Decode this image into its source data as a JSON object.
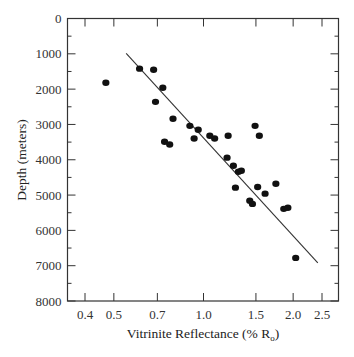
{
  "chart_data": {
    "type": "scatter",
    "title": "",
    "xlabel": "Vitrinite Reflectance  (% R",
    "xlabel_sub": "o",
    "xlabel_end": ")",
    "ylabel": "Depth  (meters)",
    "x_scale": "log",
    "xlim": [
      0.34,
      2.8
    ],
    "ylim": [
      8000,
      0
    ],
    "y_inverted": true,
    "grid": false,
    "legend": null,
    "x_ticks": [
      0.4,
      0.5,
      0.7,
      1.0,
      1.5,
      2.0,
      2.5
    ],
    "x_tick_labels": [
      "0.4",
      "0.5",
      "0.7",
      "1.0",
      "1.5",
      "2.0",
      "2.5"
    ],
    "y_ticks": [
      0,
      1000,
      2000,
      3000,
      4000,
      5000,
      6000,
      7000,
      8000
    ],
    "y_tick_labels": [
      "0",
      "1000",
      "2000",
      "3000",
      "4000",
      "5000",
      "6000",
      "7000",
      "8000"
    ],
    "series": [
      {
        "name": "samples",
        "points": [
          {
            "x": 0.47,
            "y": 1820
          },
          {
            "x": 0.61,
            "y": 1420
          },
          {
            "x": 0.68,
            "y": 1450
          },
          {
            "x": 0.73,
            "y": 1960
          },
          {
            "x": 0.69,
            "y": 2360
          },
          {
            "x": 0.79,
            "y": 2840
          },
          {
            "x": 0.74,
            "y": 3490
          },
          {
            "x": 0.77,
            "y": 3570
          },
          {
            "x": 0.9,
            "y": 3040
          },
          {
            "x": 0.96,
            "y": 3150
          },
          {
            "x": 0.93,
            "y": 3400
          },
          {
            "x": 1.05,
            "y": 3320
          },
          {
            "x": 1.09,
            "y": 3400
          },
          {
            "x": 1.21,
            "y": 3320
          },
          {
            "x": 1.49,
            "y": 3040
          },
          {
            "x": 1.54,
            "y": 3320
          },
          {
            "x": 1.2,
            "y": 3940
          },
          {
            "x": 1.26,
            "y": 4170
          },
          {
            "x": 1.31,
            "y": 4340
          },
          {
            "x": 1.34,
            "y": 4310
          },
          {
            "x": 1.28,
            "y": 4790
          },
          {
            "x": 1.52,
            "y": 4770
          },
          {
            "x": 1.61,
            "y": 4960
          },
          {
            "x": 1.75,
            "y": 4680
          },
          {
            "x": 1.43,
            "y": 5160
          },
          {
            "x": 1.46,
            "y": 5250
          },
          {
            "x": 1.86,
            "y": 5390
          },
          {
            "x": 1.92,
            "y": 5360
          },
          {
            "x": 2.04,
            "y": 6780
          }
        ]
      }
    ],
    "trend_line": {
      "x": [
        0.55,
        2.42
      ],
      "y": [
        990,
        6920
      ]
    }
  }
}
